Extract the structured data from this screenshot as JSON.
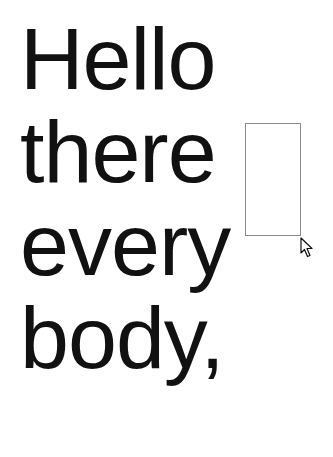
{
  "canvas": {
    "lines": [
      "Hello",
      "there",
      "every",
      "body,"
    ]
  },
  "textbox": {
    "value": ""
  },
  "colors": {
    "text": "#111111",
    "background": "#ffffff",
    "textbox_border": "#8a8a8a"
  },
  "cursor": {
    "icon": "arrow-pointer-icon"
  }
}
